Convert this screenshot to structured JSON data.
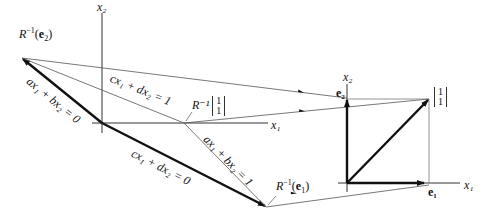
{
  "left_plot": {
    "x1_label": "x₁",
    "x2_label": "x₂",
    "R_inv_e2_label": "R⁻¹(e₂)",
    "R_inv_e1_label": "R⁻¹(e₁)",
    "R_inv_11_prefix": "R⁻¹",
    "R_inv_11_top": "1",
    "R_inv_11_bottom": "1",
    "line_ab0": "ax₁ + bx₂ = 0",
    "line_cd1": "cx₁ + dx₂ = 1",
    "line_cd0": "cx₁ + dx₂ = 0",
    "line_ab1": "ax₁ + bx₂ = 1"
  },
  "right_plot": {
    "x1_label": "x₁",
    "x2_label": "x₂",
    "e1_label": "e₁",
    "e2_label": "e₂",
    "vec11_top": "1",
    "vec11_bottom": "1"
  },
  "colors": {
    "ink": "#111111",
    "thin": "#555555"
  }
}
